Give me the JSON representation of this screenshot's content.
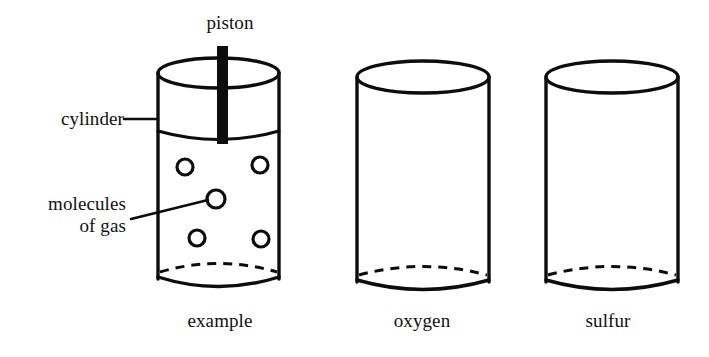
{
  "figure": {
    "type": "science-diagram",
    "background_color": "#ffffff",
    "ink_color": "#0d0d0d"
  },
  "annotations": {
    "piston": "piston",
    "cylinder": "cylinder",
    "molecules_line1": "molecules",
    "molecules_line2": "of gas"
  },
  "captions": {
    "first": "example",
    "second": "oxygen",
    "third": "sulfur"
  },
  "cylinders": [
    {
      "id": "example",
      "caption": "example",
      "has_piston": true,
      "molecule_count": 5,
      "molecules": [
        {
          "cx": 185,
          "cy": 167,
          "r": 8
        },
        {
          "cx": 260,
          "cy": 165,
          "r": 8
        },
        {
          "cx": 216,
          "cy": 199,
          "r": 9
        },
        {
          "cx": 197,
          "cy": 238,
          "r": 8
        },
        {
          "cx": 261,
          "cy": 239,
          "r": 8
        }
      ]
    },
    {
      "id": "oxygen",
      "caption": "oxygen",
      "has_piston": false,
      "molecule_count": 0,
      "molecules": []
    },
    {
      "id": "sulfur",
      "caption": "sulfur",
      "has_piston": false,
      "molecule_count": 0,
      "molecules": []
    }
  ]
}
